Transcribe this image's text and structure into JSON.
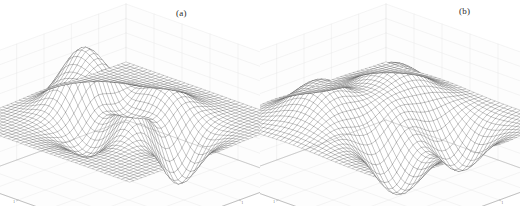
{
  "figure": {
    "background": "#ffffff",
    "mesh_color": "#4a4a4a",
    "axis_color": "#8a8a8a",
    "grid_color": "#dcdcdc",
    "text_color": "#1a1a1a"
  },
  "panels": [
    {
      "id": "a",
      "caption": "(a)",
      "zlabel": "t",
      "xlabel": "p",
      "xlabel_sub": "1",
      "ylabel": "p",
      "ylabel_sub": "2"
    },
    {
      "id": "b",
      "caption": "(b)",
      "zlabel": "a",
      "xlabel": "p",
      "xlabel_sub": "1",
      "ylabel": "p",
      "ylabel_sub": "2"
    }
  ],
  "chart_data": [
    {
      "type": "surface",
      "panel": "a",
      "title": "(a)",
      "xlabel": "p1",
      "ylabel": "p2",
      "zlabel": "t",
      "xlim": [
        -3,
        3
      ],
      "ylim": [
        -3,
        3
      ],
      "zlim": [
        -8,
        8
      ],
      "xticks": [
        -3,
        -2,
        -1,
        0,
        1,
        2,
        3
      ],
      "yticks": [
        -3,
        -2,
        -1,
        0,
        1,
        2,
        3
      ],
      "zticks": [
        -8,
        -6,
        -4,
        -2,
        0,
        2,
        4,
        6,
        8
      ],
      "grid": true,
      "legend": null,
      "render": "wireframe-mesh",
      "mesh_n": 41,
      "view": {
        "azimuth": -37.5,
        "elevation": 30
      },
      "surface_formula": "3*(1-x)^2*exp(-x^2-(y+1)^2) - 10*(x/5 - x^3 - y^5)*exp(-x^2-y^2) - (1/3)*exp(-(x+1)^2-y^2)",
      "features": [
        {
          "name": "main-peak",
          "x": -0.01,
          "y": 1.58,
          "z": 8.1
        },
        {
          "name": "secondary-peak",
          "x": 1.29,
          "y": -0.01,
          "z": 3.6
        },
        {
          "name": "deep-valley",
          "x": 0.23,
          "y": -1.63,
          "z": -6.5
        },
        {
          "name": "shallow-dip",
          "x": -1.35,
          "y": -0.2,
          "z": -3.1
        }
      ]
    },
    {
      "type": "surface",
      "panel": "b",
      "title": "(b)",
      "xlabel": "p1",
      "ylabel": "p2",
      "zlabel": "a",
      "xlim": [
        -3,
        3
      ],
      "ylim": [
        -3,
        3
      ],
      "zlim": [
        -8,
        8
      ],
      "xticks": [
        -3,
        -2,
        -1,
        0,
        1,
        2,
        3
      ],
      "yticks": [
        -3,
        -2,
        -1,
        0,
        1,
        2,
        3
      ],
      "zticks": [
        -8,
        -6,
        -4,
        -2,
        0,
        2,
        4,
        6,
        8
      ],
      "grid": true,
      "legend": null,
      "render": "wireframe-mesh",
      "mesh_n": 41,
      "view": {
        "azimuth": -37.5,
        "elevation": 30
      },
      "surface_formula": "approximated multi-modal surface with four alternating peaks and troughs",
      "features": [
        {
          "name": "left-peak",
          "x": -1.1,
          "y": 1.3,
          "z": 5.2
        },
        {
          "name": "right-peak",
          "x": 1.2,
          "y": 0.9,
          "z": 4.8
        },
        {
          "name": "front-left-trough",
          "x": -0.9,
          "y": -1.2,
          "z": -6.8
        },
        {
          "name": "front-right-trough",
          "x": 1.1,
          "y": -1.4,
          "z": -6.2
        },
        {
          "name": "center-saddle",
          "x": 0.1,
          "y": 0.0,
          "z": 0.4
        }
      ]
    }
  ]
}
